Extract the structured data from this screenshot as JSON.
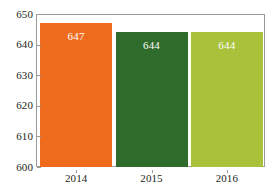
{
  "chart_data": {
    "type": "bar",
    "title": "",
    "subtitle": "",
    "xlabel": "",
    "ylabel": "",
    "categories": [
      "2014",
      "2015",
      "2016"
    ],
    "values": [
      647,
      644,
      644
    ],
    "data_labels": [
      "647",
      "644",
      "644"
    ],
    "ylim": [
      600,
      650
    ],
    "ytick_labels": [
      "600",
      "610",
      "620",
      "630",
      "640",
      "650"
    ],
    "ytick_values": [
      600,
      610,
      620,
      630,
      640,
      650
    ],
    "grid": false,
    "legend": null,
    "bar_colors": [
      "#EE6B1E",
      "#2F6B2B",
      "#A8C23C"
    ],
    "label_color": "#FFFFFF",
    "axis_color": "#9A9A9A",
    "background": "#FFFFFF"
  }
}
